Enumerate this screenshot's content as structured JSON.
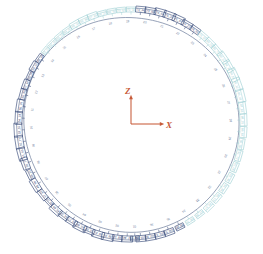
{
  "figure": {
    "background": "#ffffff",
    "width": 263,
    "height": 254,
    "ring": {
      "center_x": 131,
      "center_y": 124,
      "radius_x": 106,
      "radius_y": 109,
      "stroke": "#6a7a99",
      "stroke_width": 0.7
    },
    "palette": {
      "dark_block": "#3d4f7c",
      "light_block": "#9fd0d4",
      "ring_line": "#6a7a99",
      "axis": "#c75b39"
    }
  },
  "axes": {
    "origin_x": 131,
    "origin_y": 124,
    "z_label": "Z",
    "x_label": "X",
    "z_length": 26,
    "x_length": 30,
    "color": "#c75b39"
  },
  "chart_data": {
    "type": "scatter",
    "title": "",
    "xlabel": "X",
    "ylabel": "Z",
    "blocks": [
      {
        "id": "m01",
        "label": "37_82",
        "angle": 268,
        "w": 11,
        "h": 6,
        "tone": "dark"
      },
      {
        "id": "m02",
        "label": "38_14",
        "angle": 263,
        "w": 10,
        "h": 6,
        "tone": "dark"
      },
      {
        "id": "m03",
        "label": "39_26",
        "angle": 258,
        "w": 12,
        "h": 7,
        "tone": "dark"
      },
      {
        "id": "m04",
        "label": "40_31",
        "angle": 253,
        "w": 12,
        "h": 7,
        "tone": "dark"
      },
      {
        "id": "m05",
        "label": "41_05",
        "angle": 248,
        "w": 11,
        "h": 6,
        "tone": "dark"
      },
      {
        "id": "m06",
        "label": "42_88",
        "angle": 243,
        "w": 13,
        "h": 7,
        "tone": "dark"
      },
      {
        "id": "m07",
        "label": "43_17",
        "angle": 238,
        "w": 11,
        "h": 6,
        "tone": "dark"
      },
      {
        "id": "m08",
        "label": "44_59",
        "angle": 233,
        "w": 10,
        "h": 6,
        "tone": "dark"
      },
      {
        "id": "m09",
        "label": "45_60",
        "angle": 228,
        "w": 12,
        "h": 7,
        "tone": "dark"
      },
      {
        "id": "m10",
        "label": "46_12",
        "angle": 223,
        "w": 9,
        "h": 5,
        "tone": "dark"
      },
      {
        "id": "m11",
        "label": "47_33",
        "angle": 218,
        "w": 11,
        "h": 6,
        "tone": "dark"
      },
      {
        "id": "m12",
        "label": "48_66",
        "angle": 212,
        "w": 13,
        "h": 7,
        "tone": "dark"
      },
      {
        "id": "m13",
        "label": "49_21",
        "angle": 206,
        "w": 10,
        "h": 6,
        "tone": "dark"
      },
      {
        "id": "m14",
        "label": "50_77",
        "angle": 200,
        "w": 12,
        "h": 7,
        "tone": "dark"
      },
      {
        "id": "m15",
        "label": "51_43",
        "angle": 195,
        "w": 13,
        "h": 8,
        "tone": "dark"
      },
      {
        "id": "m16",
        "label": "52_77",
        "angle": 189,
        "w": 13,
        "h": 8,
        "tone": "dark"
      },
      {
        "id": "m17",
        "label": "53_55",
        "angle": 183,
        "w": 14,
        "h": 8,
        "tone": "dark"
      },
      {
        "id": "m18",
        "label": "54_18",
        "angle": 177,
        "w": 13,
        "h": 7,
        "tone": "dark"
      },
      {
        "id": "m19",
        "label": "55_29",
        "angle": 171,
        "w": 13,
        "h": 7,
        "tone": "dark"
      },
      {
        "id": "m20",
        "label": "56_40",
        "angle": 165,
        "w": 11,
        "h": 6,
        "tone": "dark"
      },
      {
        "id": "m21",
        "label": "57_62",
        "angle": 160,
        "w": 10,
        "h": 6,
        "tone": "dark"
      },
      {
        "id": "m22",
        "label": "58_04",
        "angle": 155,
        "w": 9,
        "h": 5,
        "tone": "dark"
      },
      {
        "id": "m23",
        "label": "59_31",
        "angle": 150,
        "w": 10,
        "h": 6,
        "tone": "dark"
      },
      {
        "id": "m24",
        "label": "60_18",
        "angle": 145,
        "w": 9,
        "h": 5,
        "tone": "dark"
      },
      {
        "id": "m25",
        "label": "61_02",
        "angle": 140,
        "w": 8,
        "h": 5,
        "tone": "light"
      },
      {
        "id": "m26",
        "label": "62_55",
        "angle": 135,
        "w": 9,
        "h": 5,
        "tone": "light"
      },
      {
        "id": "m27",
        "label": "63_73",
        "angle": 130,
        "w": 9,
        "h": 5,
        "tone": "light"
      },
      {
        "id": "m28",
        "label": "64_41",
        "angle": 125,
        "w": 9,
        "h": 5,
        "tone": "light"
      },
      {
        "id": "m29",
        "label": "65_19",
        "angle": 120,
        "w": 10,
        "h": 6,
        "tone": "light"
      },
      {
        "id": "m30",
        "label": "66_80",
        "angle": 115,
        "w": 10,
        "h": 6,
        "tone": "light"
      },
      {
        "id": "m31",
        "label": "67_24",
        "angle": 110,
        "w": 10,
        "h": 6,
        "tone": "light"
      },
      {
        "id": "m32",
        "label": "68_37",
        "angle": 105,
        "w": 9,
        "h": 5,
        "tone": "light"
      },
      {
        "id": "m33",
        "label": "69_50",
        "angle": 100,
        "w": 9,
        "h": 5,
        "tone": "light"
      },
      {
        "id": "m34",
        "label": "70_63",
        "angle": 95,
        "w": 9,
        "h": 5,
        "tone": "light"
      },
      {
        "id": "m35",
        "label": "71_11",
        "angle": 90,
        "w": 9,
        "h": 5,
        "tone": "light"
      },
      {
        "id": "m36",
        "label": "72_44",
        "angle": 85,
        "w": 10,
        "h": 6,
        "tone": "dark"
      },
      {
        "id": "m37",
        "label": "73_09",
        "angle": 80,
        "w": 11,
        "h": 6,
        "tone": "dark"
      },
      {
        "id": "m38",
        "label": "74_68",
        "angle": 75,
        "w": 11,
        "h": 7,
        "tone": "dark"
      },
      {
        "id": "m39",
        "label": "75_30",
        "angle": 70,
        "w": 12,
        "h": 7,
        "tone": "dark"
      },
      {
        "id": "m40",
        "label": "76_47",
        "angle": 65,
        "w": 12,
        "h": 7,
        "tone": "dark"
      },
      {
        "id": "m41",
        "label": "77_22",
        "angle": 60,
        "w": 11,
        "h": 6,
        "tone": "dark"
      },
      {
        "id": "m42",
        "label": "78_93",
        "angle": 55,
        "w": 10,
        "h": 6,
        "tone": "dark"
      },
      {
        "id": "m43",
        "label": "79_16",
        "angle": 50,
        "w": 10,
        "h": 6,
        "tone": "light"
      },
      {
        "id": "m44",
        "label": "80_58",
        "angle": 45,
        "w": 10,
        "h": 6,
        "tone": "light"
      },
      {
        "id": "m45",
        "label": "81_70",
        "angle": 40,
        "w": 11,
        "h": 6,
        "tone": "light"
      },
      {
        "id": "m46",
        "label": "82_07",
        "angle": 35,
        "w": 12,
        "h": 7,
        "tone": "light"
      },
      {
        "id": "m47",
        "label": "83_35",
        "angle": 30,
        "w": 12,
        "h": 7,
        "tone": "light"
      },
      {
        "id": "m48",
        "label": "84_61",
        "angle": 25,
        "w": 13,
        "h": 8,
        "tone": "light"
      },
      {
        "id": "m49",
        "label": "85_12",
        "angle": 20,
        "w": 13,
        "h": 8,
        "tone": "light"
      },
      {
        "id": "m50",
        "label": "86_49",
        "angle": 14,
        "w": 13,
        "h": 8,
        "tone": "light"
      },
      {
        "id": "m51",
        "label": "87_83",
        "angle": 8,
        "w": 12,
        "h": 7,
        "tone": "light"
      },
      {
        "id": "m52",
        "label": "88_25",
        "angle": 2,
        "w": 12,
        "h": 7,
        "tone": "light"
      },
      {
        "id": "m53",
        "label": "89_64",
        "angle": 356,
        "w": 11,
        "h": 7,
        "tone": "light"
      },
      {
        "id": "m54",
        "label": "90_38",
        "angle": 350,
        "w": 11,
        "h": 6,
        "tone": "light"
      },
      {
        "id": "m55",
        "label": "91_72",
        "angle": 344,
        "w": 11,
        "h": 6,
        "tone": "light"
      },
      {
        "id": "m56",
        "label": "92_05",
        "angle": 338,
        "w": 10,
        "h": 6,
        "tone": "light"
      },
      {
        "id": "m57",
        "label": "93_41",
        "angle": 332,
        "w": 10,
        "h": 6,
        "tone": "light"
      },
      {
        "id": "m58",
        "label": "94_86",
        "angle": 326,
        "w": 10,
        "h": 6,
        "tone": "light"
      },
      {
        "id": "m59",
        "label": "95_13",
        "angle": 320,
        "w": 10,
        "h": 6,
        "tone": "light"
      },
      {
        "id": "m60",
        "label": "96_57",
        "angle": 314,
        "w": 10,
        "h": 6,
        "tone": "light"
      },
      {
        "id": "m61",
        "label": "97_29",
        "angle": 308,
        "w": 9,
        "h": 5,
        "tone": "light"
      },
      {
        "id": "m62",
        "label": "98_74",
        "angle": 302,
        "w": 9,
        "h": 5,
        "tone": "light"
      },
      {
        "id": "m63",
        "label": "99_06",
        "angle": 296,
        "w": 9,
        "h": 5,
        "tone": "dark"
      },
      {
        "id": "m64",
        "label": "100_51",
        "angle": 290,
        "w": 10,
        "h": 6,
        "tone": "dark"
      },
      {
        "id": "m65",
        "label": "101_33",
        "angle": 285,
        "w": 10,
        "h": 6,
        "tone": "dark"
      },
      {
        "id": "m66",
        "label": "102_90",
        "angle": 280,
        "w": 10,
        "h": 6,
        "tone": "dark"
      },
      {
        "id": "m67",
        "label": "103_45",
        "angle": 275,
        "w": 10,
        "h": 6,
        "tone": "dark"
      },
      {
        "id": "m68",
        "label": "104_28",
        "angle": 272,
        "w": 9,
        "h": 5,
        "tone": "dark"
      }
    ],
    "inner_ticks": [
      {
        "label": "01",
        "angle": 272
      },
      {
        "label": "02",
        "angle": 262
      },
      {
        "label": "03",
        "angle": 252
      },
      {
        "label": "04",
        "angle": 242
      },
      {
        "label": "05",
        "angle": 232
      },
      {
        "label": "06",
        "angle": 222
      },
      {
        "label": "07",
        "angle": 212
      },
      {
        "label": "08",
        "angle": 202
      },
      {
        "label": "09",
        "angle": 192
      },
      {
        "label": "10",
        "angle": 182
      },
      {
        "label": "11",
        "angle": 172
      },
      {
        "label": "12",
        "angle": 162
      },
      {
        "label": "13",
        "angle": 152
      },
      {
        "label": "14",
        "angle": 142
      },
      {
        "label": "15",
        "angle": 132
      },
      {
        "label": "16",
        "angle": 122
      },
      {
        "label": "17",
        "angle": 112
      },
      {
        "label": "18",
        "angle": 102
      },
      {
        "label": "19",
        "angle": 92
      },
      {
        "label": "20",
        "angle": 82
      },
      {
        "label": "21",
        "angle": 72
      },
      {
        "label": "22",
        "angle": 62
      },
      {
        "label": "23",
        "angle": 52
      },
      {
        "label": "24",
        "angle": 42
      },
      {
        "label": "25",
        "angle": 32
      },
      {
        "label": "26",
        "angle": 22
      },
      {
        "label": "27",
        "angle": 12
      },
      {
        "label": "28",
        "angle": 2
      },
      {
        "label": "29",
        "angle": 352
      },
      {
        "label": "30",
        "angle": 342
      },
      {
        "label": "31",
        "angle": 332
      },
      {
        "label": "32",
        "angle": 322
      },
      {
        "label": "33",
        "angle": 312
      },
      {
        "label": "34",
        "angle": 302
      },
      {
        "label": "35",
        "angle": 292
      },
      {
        "label": "36",
        "angle": 282
      }
    ]
  }
}
